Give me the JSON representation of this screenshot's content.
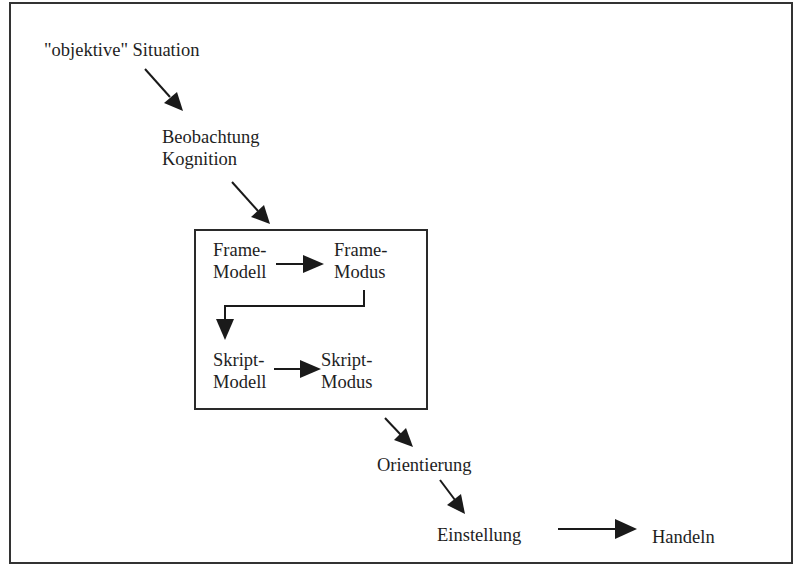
{
  "diagram": {
    "nodes": {
      "objective_situation": {
        "text": "\"objektive\" Situation"
      },
      "observation": {
        "lines": [
          "Beobachtung",
          "Kognition"
        ]
      },
      "frame_model": {
        "lines": [
          "Frame-",
          "Modell"
        ]
      },
      "frame_mode": {
        "lines": [
          "Frame-",
          "Modus"
        ]
      },
      "script_model": {
        "lines": [
          "Skript-",
          "Modell"
        ]
      },
      "script_mode": {
        "lines": [
          "Skript-",
          "Modus"
        ]
      },
      "orientation": {
        "text": "Orientierung"
      },
      "attitude": {
        "text": "Einstellung"
      },
      "action": {
        "text": "Handeln"
      }
    },
    "edges": [
      {
        "from": "objective_situation",
        "to": "observation"
      },
      {
        "from": "observation",
        "to": "frame_model_box"
      },
      {
        "from": "frame_model",
        "to": "frame_mode"
      },
      {
        "from": "frame_mode",
        "to": "script_model"
      },
      {
        "from": "script_model",
        "to": "script_mode"
      },
      {
        "from": "frame_model_box",
        "to": "orientation"
      },
      {
        "from": "orientation",
        "to": "attitude"
      },
      {
        "from": "attitude",
        "to": "action"
      }
    ],
    "colors": {
      "line": "#1a1a1a",
      "background": "#ffffff"
    }
  }
}
